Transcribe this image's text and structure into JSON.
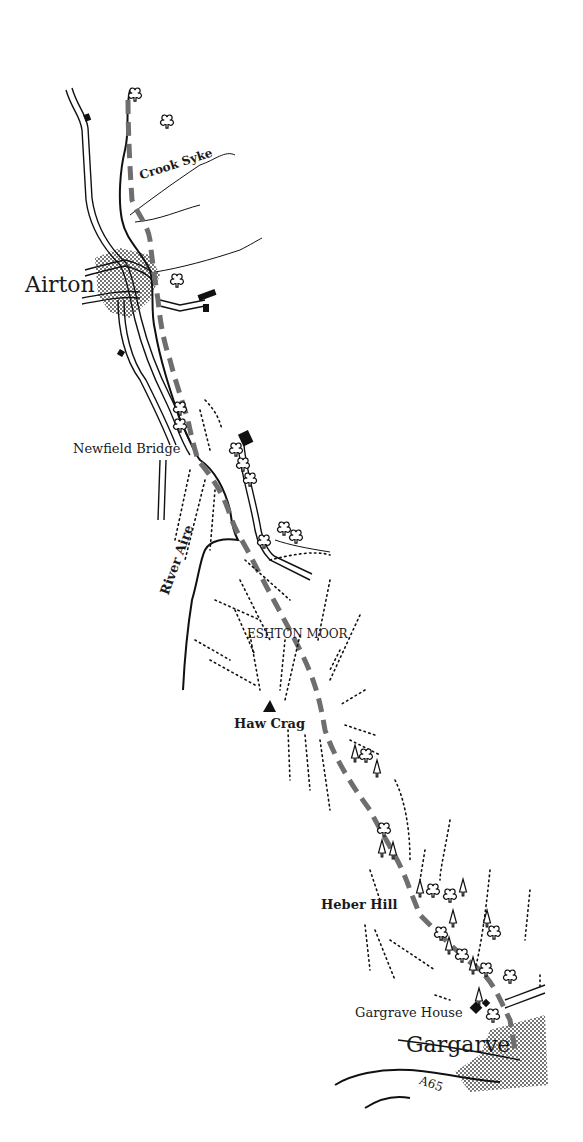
{
  "map": {
    "title": "Airton to Gargrave route map",
    "colors": {
      "route": "#6e6e6e",
      "ink": "#111111",
      "settlement_fill": "#9a9a9a",
      "background": "#ffffff"
    },
    "labels": {
      "airton": "Airton",
      "crook_syke": "Crook Syke",
      "newfield_bridge": "Newfield Bridge",
      "river_aire": "River Aire",
      "eshton_moor": "ESHTON MOOR",
      "haw_crag": "Haw Crag",
      "heber_hill": "Heber Hill",
      "gargrave_house": "Gargrave House",
      "gargarve": "Gargarve",
      "a65": "A65"
    },
    "symbols": {
      "route": "dashed-grey-path",
      "summit": "triangle-icon",
      "building": "square-icon",
      "deciduous_tree": "club-tree-icon",
      "conifer_tree": "conifer-tree-icon",
      "slope": "dotted-hachure"
    }
  }
}
